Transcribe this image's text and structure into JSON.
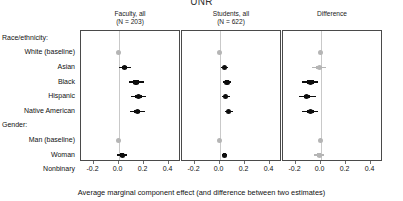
{
  "figure": {
    "title": "UNR",
    "x_caption": "Average marginal component effect (and difference between two estimates)"
  },
  "row_labels": [
    {
      "text": "Race/ethnicity:",
      "type": "group"
    },
    {
      "text": "White (baseline)",
      "type": "item"
    },
    {
      "text": "Asian",
      "type": "item"
    },
    {
      "text": "Black",
      "type": "item"
    },
    {
      "text": "Hispanic",
      "type": "item"
    },
    {
      "text": "Native American",
      "type": "item"
    },
    {
      "text": "Gender:",
      "type": "group"
    },
    {
      "text": "Man (baseline)",
      "type": "item"
    },
    {
      "text": "Woman",
      "type": "item"
    },
    {
      "text": "Nonbinary",
      "type": "item"
    }
  ],
  "colors": {
    "point_significant": "#0d0d0d",
    "point_reference": "#b5b5b5",
    "zero_line": "#c9c9c9",
    "panel_border": "#4a4a4a",
    "axis": "#6d6d6d"
  },
  "chart_data": {
    "type": "scatter",
    "title": "UNR",
    "xlabel": "Average marginal component effect (and difference between two estimates)",
    "ylabel": "",
    "grid": false,
    "legend": "none",
    "categories": [
      "Race/ethnicity:",
      "White (baseline)",
      "Asian",
      "Black",
      "Hispanic",
      "Native American",
      "Gender:",
      "Man (baseline)",
      "Woman",
      "Nonbinary"
    ],
    "panels": [
      {
        "name": "faculty-all",
        "header_line1": "Faculty, all",
        "header_line2": "(N = 203)",
        "xlim": [
          -0.3,
          0.5
        ],
        "xticks": [
          -0.2,
          0.0,
          0.2,
          0.4
        ],
        "xticklabels": [
          "-0.2",
          "0.0",
          "0.2",
          "0.4"
        ],
        "points": [
          {
            "label": "White (baseline)",
            "estimate": 0.0,
            "ci_low": 0.0,
            "ci_high": 0.0,
            "style": "reference"
          },
          {
            "label": "Asian",
            "estimate": 0.05,
            "ci_low": 0.0,
            "ci_high": 0.1,
            "style": "significant"
          },
          {
            "label": "Black",
            "estimate": 0.14,
            "ci_low": 0.08,
            "ci_high": 0.2,
            "style": "significant"
          },
          {
            "label": "Hispanic",
            "estimate": 0.16,
            "ci_low": 0.1,
            "ci_high": 0.22,
            "style": "significant"
          },
          {
            "label": "Native American",
            "estimate": 0.15,
            "ci_low": 0.09,
            "ci_high": 0.21,
            "style": "significant"
          },
          {
            "label": "Man (baseline)",
            "estimate": 0.0,
            "ci_low": 0.0,
            "ci_high": 0.0,
            "style": "reference"
          },
          {
            "label": "Woman",
            "estimate": 0.03,
            "ci_low": -0.01,
            "ci_high": 0.07,
            "style": "significant"
          },
          {
            "label": "Nonbinary",
            "estimate": 0.02,
            "ci_low": -0.03,
            "ci_high": 0.07,
            "style": "significant"
          }
        ]
      },
      {
        "name": "students-all",
        "header_line1": "Students, all",
        "header_line2": "(N = 622)",
        "xlim": [
          -0.3,
          0.5
        ],
        "xticks": [
          -0.2,
          0.0,
          0.2,
          0.4
        ],
        "xticklabels": [
          "-0.2",
          "0.0",
          "0.2",
          "0.4"
        ],
        "points": [
          {
            "label": "White (baseline)",
            "estimate": 0.0,
            "ci_low": 0.0,
            "ci_high": 0.0,
            "style": "reference"
          },
          {
            "label": "Asian",
            "estimate": 0.04,
            "ci_low": 0.01,
            "ci_high": 0.07,
            "style": "significant"
          },
          {
            "label": "Black",
            "estimate": 0.06,
            "ci_low": 0.03,
            "ci_high": 0.09,
            "style": "significant"
          },
          {
            "label": "Hispanic",
            "estimate": 0.05,
            "ci_low": 0.02,
            "ci_high": 0.08,
            "style": "significant"
          },
          {
            "label": "Native American",
            "estimate": 0.07,
            "ci_low": 0.04,
            "ci_high": 0.11,
            "style": "significant"
          },
          {
            "label": "Man (baseline)",
            "estimate": 0.0,
            "ci_low": 0.0,
            "ci_high": 0.0,
            "style": "reference"
          },
          {
            "label": "Woman",
            "estimate": 0.04,
            "ci_low": 0.02,
            "ci_high": 0.06,
            "style": "significant"
          },
          {
            "label": "Nonbinary",
            "estimate": 0.0,
            "ci_low": -0.02,
            "ci_high": 0.02,
            "style": "reference"
          }
        ]
      },
      {
        "name": "difference",
        "header_line1": "Difference",
        "header_line2": "",
        "xlim": [
          -0.3,
          0.5
        ],
        "xticks": [
          -0.2,
          0.0,
          0.2,
          0.4
        ],
        "xticklabels": [
          "-0.2",
          "0.0",
          "0.2",
          "0.4"
        ],
        "points": [
          {
            "label": "White (baseline)",
            "estimate": 0.0,
            "ci_low": 0.0,
            "ci_high": 0.0,
            "style": "reference"
          },
          {
            "label": "Asian",
            "estimate": -0.01,
            "ci_low": -0.07,
            "ci_high": 0.04,
            "style": "reference"
          },
          {
            "label": "Black",
            "estimate": -0.08,
            "ci_low": -0.15,
            "ci_high": -0.02,
            "style": "significant"
          },
          {
            "label": "Hispanic",
            "estimate": -0.11,
            "ci_low": -0.17,
            "ci_high": -0.04,
            "style": "significant"
          },
          {
            "label": "Native American",
            "estimate": -0.08,
            "ci_low": -0.15,
            "ci_high": -0.02,
            "style": "significant"
          },
          {
            "label": "Man (baseline)",
            "estimate": 0.0,
            "ci_low": 0.0,
            "ci_high": 0.0,
            "style": "reference"
          },
          {
            "label": "Woman",
            "estimate": -0.01,
            "ci_low": -0.05,
            "ci_high": 0.03,
            "style": "reference"
          },
          {
            "label": "Nonbinary",
            "estimate": -0.03,
            "ci_low": -0.09,
            "ci_high": 0.03,
            "style": "reference"
          }
        ]
      }
    ]
  }
}
